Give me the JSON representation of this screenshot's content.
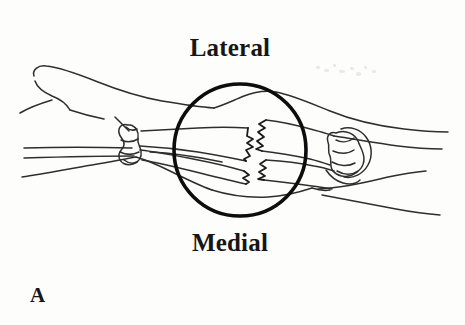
{
  "figure": {
    "type": "anatomical-line-drawing",
    "panel_label": "A",
    "labels": {
      "top": "Lateral",
      "bottom": "Medial"
    },
    "colors": {
      "background": "#fdfdfc",
      "ink": "#1a1a1a",
      "soft_tissue_ink": "#3a3a3a",
      "circle_stroke": "#0d0d0d",
      "text": "#161616"
    },
    "magnifier_circle": {
      "center_x": 240,
      "center_y": 150,
      "radius": 66,
      "stroke_width": 3.6
    },
    "structures": [
      {
        "name": "hand-outline",
        "side": "left"
      },
      {
        "name": "thumb-outline",
        "side": "left"
      },
      {
        "name": "wrist-carpal-bones",
        "side": "left"
      },
      {
        "name": "radius-bone",
        "side": "center"
      },
      {
        "name": "ulna-bone",
        "side": "center"
      },
      {
        "name": "radius-fracture-zigzag",
        "side": "center"
      },
      {
        "name": "ulna-fracture-zigzag",
        "side": "center"
      },
      {
        "name": "elbow-olecranon",
        "side": "right"
      },
      {
        "name": "upper-arm-outline",
        "side": "right"
      }
    ]
  }
}
